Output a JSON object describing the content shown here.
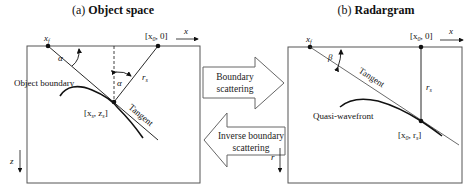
{
  "panel_a": {
    "title_prefix": "(a) ",
    "title_bold": "Object space",
    "label_xf": "x",
    "label_xf_sub": "f",
    "label_x0": "[x",
    "label_x0_sub": "0",
    "label_x0_rest": ", 0]",
    "axis_x": "x",
    "axis_z": "z",
    "angle_alpha_top": "α",
    "angle_alpha_mid": "α",
    "label_rs": "r",
    "label_rs_sub": "s",
    "label_object_boundary": "Object boundary",
    "label_point": "[x",
    "label_point_sub1": "s",
    "label_point_mid": ", z",
    "label_point_sub2": "s",
    "label_point_end": "]",
    "label_tangent": "Tangent"
  },
  "panel_b": {
    "title_prefix": "(b) ",
    "title_bold": "Radargram",
    "label_xf": "x",
    "label_xf_sub": "f",
    "label_x0": "[x",
    "label_x0_sub": "0",
    "label_x0_rest": ", 0]",
    "axis_x": "x",
    "axis_r": "r",
    "angle_beta": "β",
    "label_rs": "r",
    "label_rs_sub": "s",
    "label_tangent": "Tangent",
    "label_quasi": "Quasi-wavefront",
    "label_point": "[x",
    "label_point_sub1": "0",
    "label_point_mid": ", r",
    "label_point_sub2": "s",
    "label_point_end": "]"
  },
  "arrows": {
    "forward_line1": "Boundary",
    "forward_line2": "scattering",
    "inverse_line1": "Inverse boundary",
    "inverse_line2": "scattering"
  },
  "colors": {
    "line": "#111111",
    "box": "#555555",
    "arrow_outline": "#666666"
  }
}
